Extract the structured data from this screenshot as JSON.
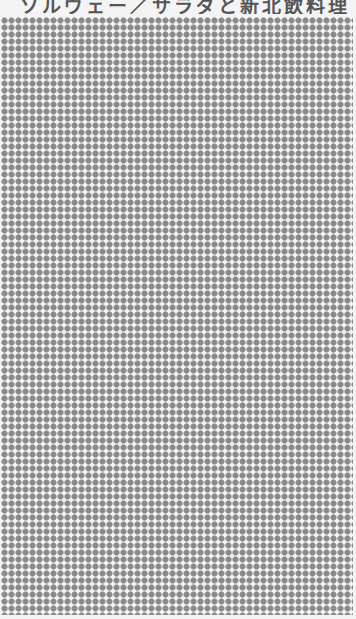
{
  "title": {
    "text": "ソルヴェー／サラダと新北飲料理",
    "color": "#555555",
    "clipped": true
  },
  "pattern": {
    "type": "dot-grid",
    "dot_color": "#8a8a8a",
    "background_color": "#f4f4f4",
    "pitch_px": 7,
    "dot_size_px": 6
  }
}
